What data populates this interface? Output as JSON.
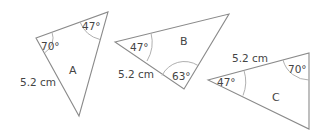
{
  "triangles": [
    {
      "name": "A",
      "angles": [
        "70°",
        "47°"
      ],
      "side": "5.2 cm"
    },
    {
      "name": "B",
      "angles": [
        "47°",
        "63°"
      ],
      "side": "5.2 cm"
    },
    {
      "name": "C",
      "angles": [
        "47°",
        "70°"
      ],
      "side": "5.2 cm"
    }
  ]
}
